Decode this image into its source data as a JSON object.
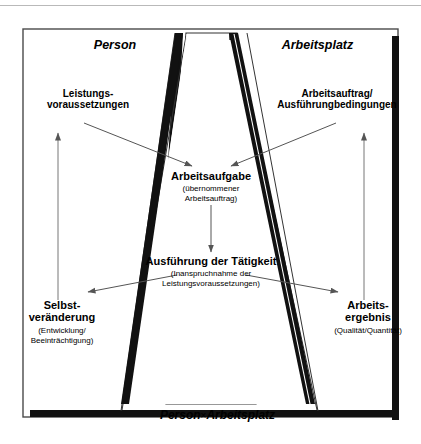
{
  "figure": {
    "type": "concept-diagram",
    "caption_bottom_main": "Person",
    "caption_bottom_times": "×",
    "caption_bottom_second": "Arbeitsplatz",
    "zones": [
      {
        "id": "person",
        "label": "Person"
      },
      {
        "id": "arbeitsplatz",
        "label": "Arbeitsplatz"
      }
    ],
    "nodes": [
      {
        "id": "leistungsvoraussetzungen",
        "title": "Leistungs-\nvoraussetzungen",
        "subtitle": ""
      },
      {
        "id": "arbeitsauftrag",
        "title": "Arbeitsauftrag/\nAusführungbedingungen",
        "subtitle": ""
      },
      {
        "id": "arbeitsaufgabe",
        "title": "Arbeitsaufgabe",
        "subtitle": "(übernommener\nArbeitsauftrag)"
      },
      {
        "id": "ausfuehrung",
        "title": "Ausführung der Tätigkeit",
        "subtitle": "(Inanspruchnahme der\nLeistungsvoraussetzungen)"
      },
      {
        "id": "selbstveraenderung",
        "title": "Selbst-\nveränderung",
        "subtitle": "(Entwicklung/\nBeeinträchtigung)"
      },
      {
        "id": "arbeitsergebnis",
        "title": "Arbeits-\nergebnis",
        "subtitle": "(Qualität/Quantität)"
      }
    ],
    "colors": {
      "ink": "#000000",
      "paper": "#ffffff",
      "frame": "#4a4a4a",
      "rule": "#b9b9b9",
      "arrow": "#555555"
    }
  }
}
